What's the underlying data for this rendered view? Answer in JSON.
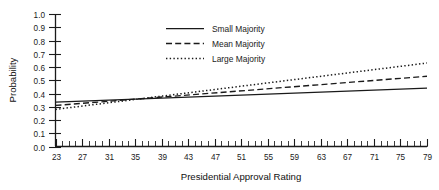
{
  "chart_data": {
    "type": "line",
    "title": "",
    "xlabel": "Presidential Approval Rating",
    "ylabel": "Probability",
    "xlim": [
      23,
      79
    ],
    "ylim": [
      0.0,
      1.0
    ],
    "grid": false,
    "legend_position": "top-center",
    "x_tick_labels": [
      "23",
      "27",
      "31",
      "35",
      "39",
      "43",
      "47",
      "51",
      "55",
      "59",
      "63",
      "67",
      "71",
      "75",
      "79"
    ],
    "x_tick_values": [
      23,
      27,
      31,
      35,
      39,
      43,
      47,
      51,
      55,
      59,
      63,
      67,
      71,
      75,
      79
    ],
    "x_minor_tick_step": 1,
    "y_tick_labels": [
      "1.0",
      "0.9",
      "0.8",
      "0.7",
      "0.6",
      "0.5",
      "0.4",
      "0.3",
      "0.2",
      "0.1",
      "0.0"
    ],
    "y_tick_values": [
      1.0,
      0.9,
      0.8,
      0.7,
      0.6,
      0.5,
      0.4,
      0.3,
      0.2,
      0.1,
      0.0
    ],
    "x": [
      23,
      79
    ],
    "series": [
      {
        "name": "Small Majority",
        "style": "solid",
        "color": "#1a1a1a",
        "values": [
          0.335,
          0.44
        ]
      },
      {
        "name": "Mean Majority",
        "style": "dashed",
        "color": "#1a1a1a",
        "values": [
          0.31,
          0.53
        ]
      },
      {
        "name": "Large Majority",
        "style": "dotted",
        "color": "#1a1a1a",
        "values": [
          0.28,
          0.63
        ]
      }
    ],
    "legend": [
      {
        "label": "Small Majority",
        "style": "solid"
      },
      {
        "label": "Mean Majority",
        "style": "dashed"
      },
      {
        "label": "Large Majority",
        "style": "dotted"
      }
    ]
  },
  "colors": {
    "background": "#ffffff",
    "axis": "#1a1a1a",
    "text": "#1a1a1a"
  }
}
